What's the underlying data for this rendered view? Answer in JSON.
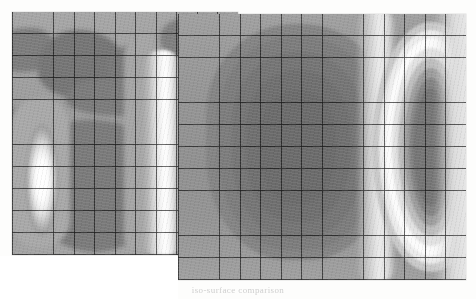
{
  "figure": {
    "background_color": "#fdfdfc",
    "caption": "iso-surface comparison",
    "panels": [
      {
        "id": "left",
        "name": "left-contour-panel",
        "x": 12,
        "y": 12,
        "width": 226,
        "height": 243,
        "grid_cols": 11,
        "grid_rows": 11,
        "grid_color": "#3a3a3a",
        "mesh_visible": true
      },
      {
        "id": "right",
        "name": "right-contour-panel",
        "x": 178,
        "y": 14,
        "width": 288,
        "height": 266,
        "grid_cols": 14,
        "grid_rows": 12,
        "grid_color": "#3a3a3a",
        "mesh_visible": true
      }
    ]
  },
  "palette": {
    "white": "#ffffff",
    "light": "#d8d8d8",
    "mid_light": "#b4b4b4",
    "mid": "#9a9a9a",
    "mid_dark": "#848484",
    "dark": "#707070",
    "darkest": "#626262",
    "mesh": "#3a3a3a"
  },
  "chart_data": {
    "type": "heatmap",
    "title": "",
    "subtitle": "",
    "xlabel": "",
    "ylabel": "",
    "legend": [],
    "grid": true,
    "colorscale": "grayscale",
    "panels": [
      {
        "name": "left",
        "description": "Irregular patchy contour field with a bright vertical lobe on the left and a tall bright band near the right edge.",
        "nx": 11,
        "ny": 11,
        "zmin": 0.0,
        "zmax": 1.0,
        "values": [
          [
            0.42,
            0.4,
            0.38,
            0.44,
            0.46,
            0.42,
            0.38,
            0.4,
            0.52,
            0.66,
            0.5
          ],
          [
            0.4,
            0.3,
            0.26,
            0.34,
            0.44,
            0.3,
            0.26,
            0.34,
            0.56,
            0.74,
            0.54
          ],
          [
            0.38,
            0.24,
            0.2,
            0.28,
            0.4,
            0.24,
            0.22,
            0.32,
            0.6,
            0.86,
            0.58
          ],
          [
            0.4,
            0.28,
            0.24,
            0.3,
            0.38,
            0.26,
            0.24,
            0.34,
            0.62,
            0.92,
            0.6
          ],
          [
            0.46,
            0.4,
            0.36,
            0.34,
            0.36,
            0.34,
            0.3,
            0.38,
            0.64,
            0.96,
            0.62
          ],
          [
            0.58,
            0.72,
            0.58,
            0.36,
            0.32,
            0.3,
            0.28,
            0.38,
            0.66,
            0.98,
            0.62
          ],
          [
            0.7,
            0.92,
            0.7,
            0.38,
            0.3,
            0.28,
            0.28,
            0.38,
            0.66,
            0.97,
            0.6
          ],
          [
            0.74,
            0.98,
            0.74,
            0.38,
            0.28,
            0.26,
            0.28,
            0.38,
            0.64,
            0.94,
            0.58
          ],
          [
            0.7,
            0.93,
            0.7,
            0.38,
            0.28,
            0.26,
            0.28,
            0.38,
            0.62,
            0.9,
            0.56
          ],
          [
            0.58,
            0.76,
            0.58,
            0.36,
            0.3,
            0.28,
            0.3,
            0.38,
            0.58,
            0.82,
            0.52
          ],
          [
            0.46,
            0.5,
            0.44,
            0.34,
            0.32,
            0.3,
            0.3,
            0.38,
            0.52,
            0.7,
            0.46
          ]
        ]
      },
      {
        "name": "right",
        "description": "Smooth nested contour field: a broad dark dome on the left-centre and a concentric bright/dark elliptical stack on the right.",
        "nx": 14,
        "ny": 12,
        "zmin": 0.0,
        "zmax": 1.0,
        "values": [
          [
            0.46,
            0.44,
            0.4,
            0.36,
            0.34,
            0.34,
            0.36,
            0.4,
            0.48,
            0.62,
            0.8,
            0.92,
            0.76,
            0.56
          ],
          [
            0.44,
            0.38,
            0.32,
            0.28,
            0.25,
            0.25,
            0.28,
            0.34,
            0.46,
            0.66,
            0.88,
            0.98,
            0.82,
            0.58
          ],
          [
            0.42,
            0.34,
            0.28,
            0.22,
            0.19,
            0.19,
            0.22,
            0.3,
            0.46,
            0.7,
            0.92,
            1.0,
            0.84,
            0.58
          ],
          [
            0.41,
            0.32,
            0.25,
            0.19,
            0.15,
            0.15,
            0.19,
            0.28,
            0.45,
            0.72,
            0.94,
            0.98,
            0.8,
            0.55
          ],
          [
            0.4,
            0.31,
            0.23,
            0.17,
            0.13,
            0.13,
            0.17,
            0.27,
            0.45,
            0.72,
            0.92,
            0.9,
            0.7,
            0.5
          ],
          [
            0.4,
            0.3,
            0.22,
            0.16,
            0.12,
            0.12,
            0.16,
            0.26,
            0.44,
            0.72,
            0.9,
            0.82,
            0.6,
            0.45
          ],
          [
            0.4,
            0.3,
            0.22,
            0.16,
            0.12,
            0.12,
            0.16,
            0.26,
            0.44,
            0.72,
            0.9,
            0.8,
            0.56,
            0.43
          ],
          [
            0.4,
            0.31,
            0.23,
            0.17,
            0.13,
            0.13,
            0.17,
            0.27,
            0.45,
            0.72,
            0.92,
            0.86,
            0.64,
            0.47
          ],
          [
            0.41,
            0.32,
            0.25,
            0.19,
            0.15,
            0.15,
            0.19,
            0.28,
            0.46,
            0.72,
            0.94,
            0.94,
            0.74,
            0.52
          ],
          [
            0.42,
            0.34,
            0.28,
            0.22,
            0.19,
            0.19,
            0.22,
            0.3,
            0.47,
            0.7,
            0.93,
            0.99,
            0.82,
            0.57
          ],
          [
            0.44,
            0.38,
            0.33,
            0.28,
            0.25,
            0.25,
            0.28,
            0.35,
            0.48,
            0.67,
            0.88,
            0.97,
            0.8,
            0.57
          ],
          [
            0.47,
            0.43,
            0.39,
            0.35,
            0.33,
            0.33,
            0.35,
            0.4,
            0.5,
            0.62,
            0.78,
            0.88,
            0.72,
            0.54
          ]
        ]
      }
    ]
  }
}
